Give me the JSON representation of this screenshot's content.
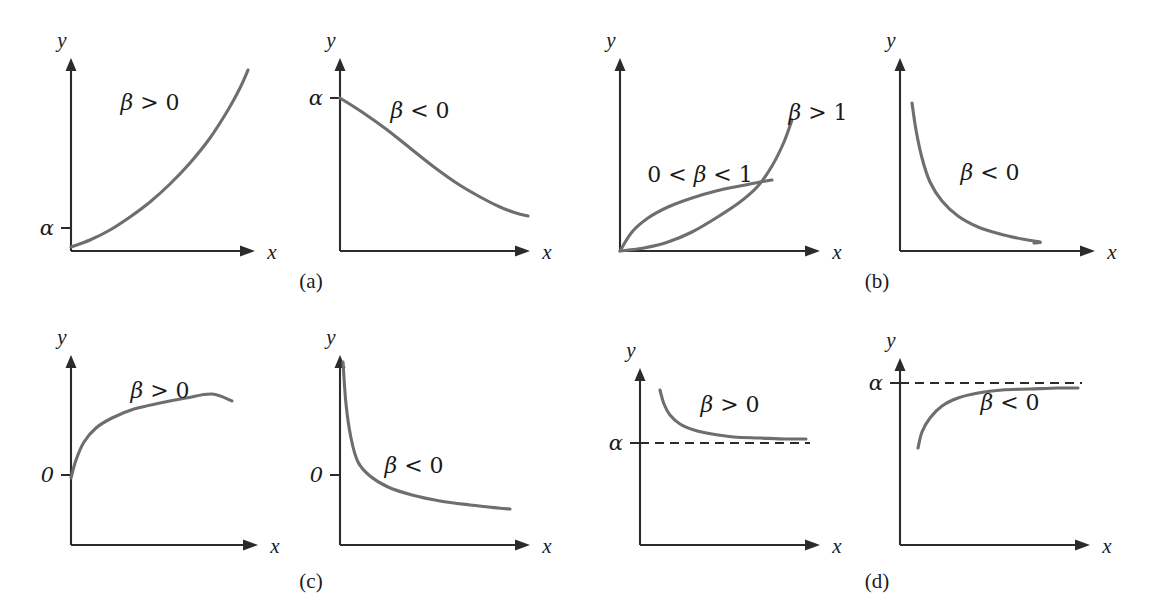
{
  "figure": {
    "type": "multi-panel-line-chart-figure",
    "panel_count": 8,
    "caption_groups": [
      "(a)",
      "(b)",
      "(c)",
      "(d)"
    ],
    "colors": {
      "curve": "#6e6e6e",
      "axis": "#2b2b2b",
      "text": "#1a1a1a",
      "background": "#ffffff"
    }
  },
  "captions": [
    {
      "id": "caption-a",
      "text": "(a)",
      "x": 311,
      "y": 288
    },
    {
      "id": "caption-b",
      "text": "(b)",
      "x": 877,
      "y": 288
    },
    {
      "id": "caption-c",
      "text": "(c)",
      "x": 311,
      "y": 588
    },
    {
      "id": "caption-d",
      "text": "(d)",
      "x": 877,
      "y": 588
    }
  ],
  "chart_data": [
    {
      "id": "panel-1",
      "type": "line",
      "title": "",
      "xlabel": "x",
      "ylabel": "y",
      "grid": false,
      "legend": "none",
      "annotations": [
        {
          "text": "β > 0",
          "x": 150,
          "y": 110,
          "beta": "β",
          "relation": ">",
          "value": "0"
        }
      ],
      "y_ticks": [
        {
          "label": "α",
          "y": 228
        }
      ],
      "x_ticks": [],
      "axis": {
        "ox": 71,
        "oy": 251,
        "x_end": 255,
        "y_top": 58
      },
      "series": [
        {
          "name": "exponential growth",
          "equation": "y = alpha*exp(beta*x), beta > 0",
          "points": [
            [
              71,
              247
            ],
            [
              90,
              240
            ],
            [
              110,
              230
            ],
            [
              130,
              217
            ],
            [
              150,
              202
            ],
            [
              170,
              184
            ],
            [
              190,
              163
            ],
            [
              210,
              138
            ],
            [
              228,
              110
            ],
            [
              240,
              88
            ],
            [
              248,
              70
            ]
          ]
        }
      ]
    },
    {
      "id": "panel-2",
      "type": "line",
      "title": "",
      "xlabel": "x",
      "ylabel": "y",
      "grid": false,
      "legend": "none",
      "annotations": [
        {
          "text": "β < 0",
          "x": 420,
          "y": 118,
          "beta": "β",
          "relation": "<",
          "value": "0"
        }
      ],
      "y_ticks": [
        {
          "label": "α",
          "y": 98
        }
      ],
      "x_ticks": [],
      "axis": {
        "ox": 340,
        "oy": 251,
        "x_end": 530,
        "y_top": 58
      },
      "series": [
        {
          "name": "exponential decay",
          "equation": "y = alpha*exp(beta*x), beta < 0",
          "points": [
            [
              340,
              98
            ],
            [
              362,
              112
            ],
            [
              386,
              129
            ],
            [
              410,
              148
            ],
            [
              434,
              167
            ],
            [
              458,
              184
            ],
            [
              482,
              198
            ],
            [
              500,
              207
            ],
            [
              516,
              213
            ],
            [
              528,
              216
            ]
          ]
        }
      ]
    },
    {
      "id": "panel-3",
      "type": "line",
      "title": "",
      "xlabel": "x",
      "ylabel": "y",
      "grid": false,
      "legend": "none",
      "annotations": [
        {
          "text": "0 < β < 1",
          "x": 700,
          "y": 182,
          "beta": "β",
          "relation": "0 < ... < 1",
          "value": "1"
        },
        {
          "text": "β > 1",
          "x": 818,
          "y": 120,
          "beta": "β",
          "relation": ">",
          "value": "1"
        }
      ],
      "y_ticks": [],
      "x_ticks": [],
      "axis": {
        "ox": 620,
        "oy": 251,
        "x_end": 820,
        "y_top": 58
      },
      "series": [
        {
          "name": "0 < beta < 1 power curve",
          "equation": "y = alpha*x^beta, 0 < beta < 1",
          "points": [
            [
              620,
              251
            ],
            [
              632,
              232
            ],
            [
              648,
              218
            ],
            [
              668,
              207
            ],
            [
              692,
              198
            ],
            [
              716,
              191
            ],
            [
              740,
              186
            ],
            [
              760,
              182
            ],
            [
              772,
              180
            ]
          ]
        },
        {
          "name": "beta > 1 power curve",
          "equation": "y = alpha*x^beta, beta > 1",
          "points": [
            [
              620,
              251
            ],
            [
              644,
              248
            ],
            [
              668,
              242
            ],
            [
              692,
              232
            ],
            [
              716,
              218
            ],
            [
              740,
              202
            ],
            [
              758,
              186
            ],
            [
              772,
              166
            ],
            [
              784,
              142
            ],
            [
              792,
              120
            ]
          ]
        }
      ]
    },
    {
      "id": "panel-4",
      "type": "line",
      "title": "",
      "xlabel": "x",
      "ylabel": "y",
      "grid": false,
      "legend": "none",
      "annotations": [
        {
          "text": "β < 0",
          "x": 990,
          "y": 180,
          "beta": "β",
          "relation": "<",
          "value": "0"
        }
      ],
      "y_ticks": [],
      "x_ticks": [],
      "axis": {
        "ox": 900,
        "oy": 251,
        "x_end": 1095,
        "y_top": 58
      },
      "series": [
        {
          "name": "negative power decay",
          "equation": "y = alpha*x^beta, beta < 0",
          "points": [
            [
              912,
              103
            ],
            [
              916,
              130
            ],
            [
              922,
              158
            ],
            [
              930,
              182
            ],
            [
              942,
              201
            ],
            [
              958,
              216
            ],
            [
              978,
              227
            ],
            [
              1000,
              234
            ],
            [
              1022,
              239
            ],
            [
              1040,
              242
            ],
            [
              1034,
              243
            ]
          ]
        }
      ]
    },
    {
      "id": "panel-5",
      "type": "line",
      "title": "",
      "xlabel": "x",
      "ylabel": "y",
      "grid": false,
      "legend": "none",
      "annotations": [
        {
          "text": "β > 0",
          "x": 160,
          "y": 398,
          "beta": "β",
          "relation": ">",
          "value": "0"
        }
      ],
      "y_ticks": [
        {
          "label": "0",
          "y": 475
        }
      ],
      "x_ticks": [],
      "axis": {
        "ox": 71,
        "oy": 545,
        "x_end": 258,
        "y_top": 355
      },
      "series": [
        {
          "name": "logarithmic growth",
          "equation": "y = alpha + beta*ln(x), beta > 0",
          "points": [
            [
              71,
              478
            ],
            [
              76,
              460
            ],
            [
              84,
              442
            ],
            [
              96,
              428
            ],
            [
              112,
              418
            ],
            [
              134,
              409
            ],
            [
              160,
              403
            ],
            [
              186,
              398
            ],
            [
              212,
              394
            ],
            [
              232,
              401
            ]
          ]
        }
      ]
    },
    {
      "id": "panel-6",
      "type": "line",
      "title": "",
      "xlabel": "x",
      "ylabel": "y",
      "grid": false,
      "legend": "none",
      "annotations": [
        {
          "text": "β < 0",
          "x": 414,
          "y": 473,
          "beta": "β",
          "relation": "<",
          "value": "0"
        }
      ],
      "y_ticks": [
        {
          "label": "0",
          "y": 475
        }
      ],
      "x_ticks": [],
      "axis": {
        "ox": 340,
        "oy": 545,
        "x_end": 530,
        "y_top": 355
      },
      "series": [
        {
          "name": "logarithmic decay",
          "equation": "y = alpha + beta*ln(x), beta < 0",
          "points": [
            [
              343,
              362
            ],
            [
              346,
              404
            ],
            [
              351,
              438
            ],
            [
              358,
              462
            ],
            [
              370,
              476
            ],
            [
              388,
              487
            ],
            [
              412,
              495
            ],
            [
              440,
              501
            ],
            [
              470,
              505
            ],
            [
              498,
              508
            ],
            [
              510,
              509
            ]
          ]
        }
      ]
    },
    {
      "id": "panel-7",
      "type": "line",
      "title": "",
      "xlabel": "x",
      "ylabel": "y",
      "grid": false,
      "legend": "none",
      "annotations": [
        {
          "text": "β > 0",
          "x": 730,
          "y": 412,
          "beta": "β",
          "relation": ">",
          "value": "0"
        }
      ],
      "y_ticks": [
        {
          "label": "α",
          "y": 443
        }
      ],
      "x_ticks": [],
      "axis": {
        "ox": 640,
        "oy": 545,
        "x_end": 820,
        "y_top": 368
      },
      "asymptote": {
        "label": "α",
        "y": 443,
        "x_start": 640,
        "x_end": 810
      },
      "series": [
        {
          "name": "reciprocal decay to alpha",
          "equation": "y = alpha + beta/x, beta > 0",
          "points": [
            [
              660,
              390
            ],
            [
              664,
              404
            ],
            [
              670,
              415
            ],
            [
              680,
              424
            ],
            [
              694,
              430
            ],
            [
              712,
              434
            ],
            [
              734,
              437
            ],
            [
              760,
              438
            ],
            [
              786,
              439
            ],
            [
              806,
              439
            ]
          ]
        }
      ]
    },
    {
      "id": "panel-8",
      "type": "line",
      "title": "",
      "xlabel": "x",
      "ylabel": "y",
      "grid": false,
      "legend": "none",
      "annotations": [
        {
          "text": "β < 0",
          "x": 1010,
          "y": 410,
          "beta": "β",
          "relation": "<",
          "value": "0"
        }
      ],
      "y_ticks": [
        {
          "label": "α",
          "y": 383
        }
      ],
      "x_ticks": [],
      "axis": {
        "ox": 900,
        "oy": 545,
        "x_end": 1090,
        "y_top": 358
      },
      "asymptote": {
        "label": "α",
        "y": 383,
        "x_start": 900,
        "x_end": 1082
      },
      "series": [
        {
          "name": "reciprocal rise to alpha",
          "equation": "y = alpha + beta/x, beta < 0",
          "points": [
            [
              918,
              448
            ],
            [
              922,
              432
            ],
            [
              930,
              418
            ],
            [
              942,
              406
            ],
            [
              958,
              398
            ],
            [
              978,
              393
            ],
            [
              1002,
              390
            ],
            [
              1030,
              389
            ],
            [
              1058,
              388
            ],
            [
              1078,
              388
            ]
          ]
        }
      ]
    }
  ]
}
